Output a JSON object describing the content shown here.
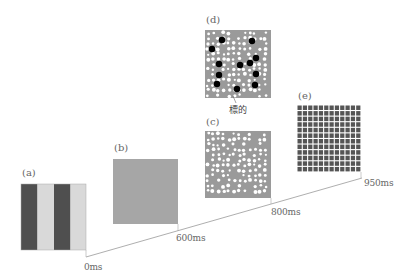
{
  "figure": {
    "panels": [
      {
        "id": "a",
        "label": "(a)",
        "description": "vertical stripes",
        "stripes": [
          "#4f4f4f",
          "#d9d9d9",
          "#4f4f4f",
          "#d9d9d9"
        ]
      },
      {
        "id": "b",
        "label": "(b)",
        "description": "uniform gray field",
        "fill": "#a6a6a6"
      },
      {
        "id": "c",
        "label": "(c)",
        "description": "gray field with white dots"
      },
      {
        "id": "d",
        "label": "(d)",
        "description": "white dots with black targets",
        "annotation": "標的"
      },
      {
        "id": "e",
        "label": "(e)",
        "description": "dark grid mask"
      }
    ],
    "timeline": {
      "ticks": [
        "0ms",
        "600ms",
        "800ms",
        "950ms"
      ]
    },
    "colors": {
      "panel_gray": "#a6a6a6",
      "dot_white": "#ffffff",
      "target_black": "#000000",
      "mask_dark": "#555555",
      "line": "#888888"
    }
  }
}
